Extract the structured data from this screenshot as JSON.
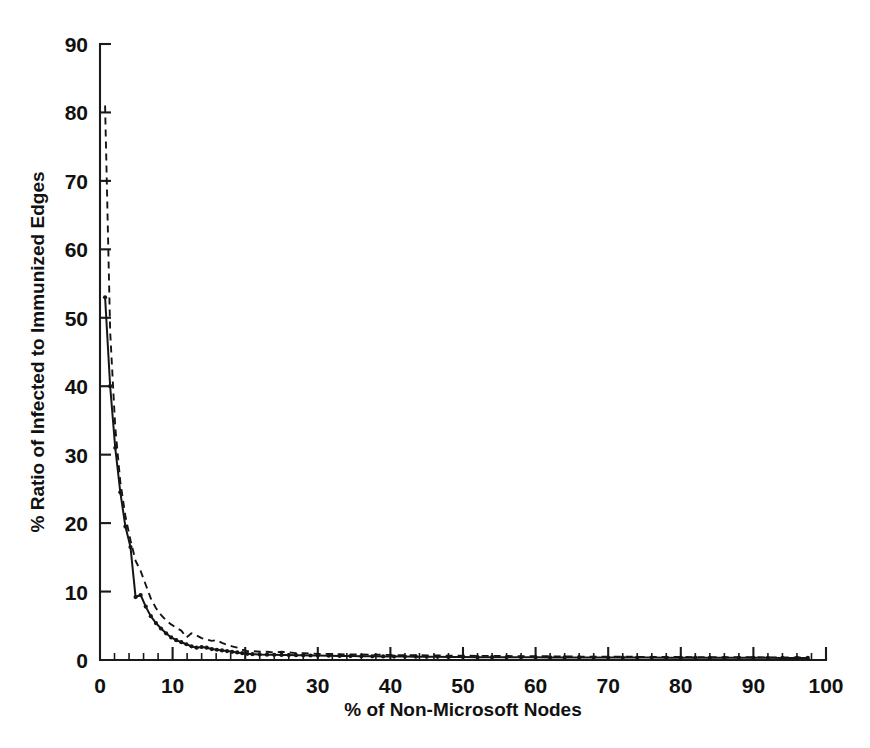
{
  "chart_data": {
    "type": "line",
    "title": "",
    "xlabel": "% of Non-Microsoft Nodes",
    "ylabel": "% Ratio of Infected to Immunized Edges",
    "xlim": [
      0,
      100
    ],
    "ylim": [
      0,
      90
    ],
    "xticks": [
      0,
      10,
      20,
      30,
      40,
      50,
      60,
      70,
      80,
      90,
      100
    ],
    "yticks": [
      0,
      10,
      20,
      30,
      40,
      50,
      60,
      70,
      80,
      90
    ],
    "xtick_labels": [
      "0",
      "10",
      "20",
      "30",
      "40",
      "50",
      "60",
      "70",
      "80",
      "90",
      "100"
    ],
    "ytick_labels": [
      "0",
      "10",
      "20",
      "30",
      "40",
      "50",
      "60",
      "70",
      "80",
      "90"
    ],
    "x_minor_step": 2,
    "grid": false,
    "legend": "none",
    "series": [
      {
        "name": "solid-curve",
        "style": "solid",
        "markers": true,
        "x": [
          0.7,
          1.4,
          2.1,
          2.8,
          3.5,
          4.2,
          4.9,
          5.6,
          6.3,
          7.0,
          7.7,
          8.4,
          9.1,
          9.8,
          10.5,
          11.2,
          11.9,
          12.6,
          13.3,
          14.0,
          14.7,
          15.4,
          16.1,
          16.8,
          17.5,
          18.2,
          18.9,
          19.6,
          20.3,
          21.0,
          22.0,
          23.0,
          24.0,
          25.0,
          26.0,
          27.0,
          28.0,
          29.0,
          30.0,
          31.5,
          33.0,
          34.5,
          36.0,
          37.5,
          39.0,
          40.5,
          42.0,
          43.5,
          45.0,
          46.5,
          48.0,
          50.0,
          52.0,
          54.0,
          56.0,
          58.0,
          60.0,
          62.0,
          64.0,
          66.0,
          68.0,
          70.0,
          72.0,
          74.0,
          76.0,
          78.0,
          80.0,
          82.0,
          84.0,
          86.0,
          88.0,
          90.0,
          92.0,
          94.0,
          96.0,
          97.5
        ],
        "y": [
          53.0,
          40.0,
          31.0,
          24.5,
          19.5,
          16.5,
          9.2,
          9.5,
          7.8,
          6.4,
          5.4,
          4.6,
          3.9,
          3.3,
          2.9,
          2.6,
          2.3,
          2.0,
          1.8,
          1.9,
          1.8,
          1.6,
          1.5,
          1.4,
          1.3,
          1.2,
          1.1,
          1.0,
          0.9,
          0.85,
          0.8,
          0.78,
          0.76,
          0.74,
          0.72,
          0.7,
          0.68,
          0.66,
          0.64,
          0.62,
          0.6,
          0.58,
          0.56,
          0.54,
          0.52,
          0.5,
          0.5,
          0.48,
          0.46,
          0.46,
          0.44,
          0.44,
          0.42,
          0.42,
          0.4,
          0.4,
          0.4,
          0.38,
          0.38,
          0.38,
          0.36,
          0.36,
          0.36,
          0.35,
          0.35,
          0.34,
          0.34,
          0.34,
          0.33,
          0.33,
          0.32,
          0.32,
          0.32,
          0.31,
          0.31,
          0.3
        ]
      },
      {
        "name": "dashed-curve",
        "style": "dashed",
        "markers": false,
        "x": [
          0.7,
          1.4,
          2.1,
          2.8,
          3.5,
          4.2,
          4.9,
          5.6,
          6.3,
          7.0,
          7.7,
          8.4,
          9.1,
          9.8,
          10.5,
          11.2,
          11.9,
          12.6,
          13.3,
          14.0,
          14.7,
          15.4,
          16.1,
          16.8,
          17.5,
          18.2,
          18.9,
          19.6,
          20.3,
          21.0,
          22.0,
          23.0,
          24.0,
          25.0,
          26.0,
          27.0,
          28.0,
          29.0,
          30.0,
          31.5,
          33.0,
          34.5,
          36.0,
          37.5,
          39.0,
          40.5,
          42.0,
          43.5,
          45.0,
          46.5,
          48.0,
          50.0,
          52.0,
          54.0,
          56.0,
          58.0,
          60.0,
          62.0,
          64.0,
          66.0,
          68.0,
          70.0,
          72.0,
          74.0,
          76.0,
          78.0,
          80.0,
          82.0,
          84.0,
          86.0,
          88.0,
          90.0,
          92.0,
          94.0,
          96.0,
          97.5
        ],
        "y": [
          81.0,
          48.0,
          34.0,
          26.0,
          21.0,
          17.5,
          14.5,
          13.0,
          11.0,
          9.0,
          7.6,
          6.6,
          5.8,
          5.2,
          4.7,
          4.3,
          3.3,
          3.9,
          3.6,
          3.2,
          3.0,
          2.8,
          2.9,
          2.5,
          2.2,
          2.0,
          1.8,
          1.5,
          1.3,
          1.3,
          1.2,
          1.2,
          1.1,
          1.2,
          1.1,
          1.0,
          1.0,
          0.95,
          0.9,
          0.9,
          0.85,
          0.8,
          0.8,
          0.78,
          0.75,
          0.72,
          0.7,
          0.7,
          0.68,
          0.66,
          0.64,
          0.62,
          0.6,
          0.6,
          0.58,
          0.56,
          0.55,
          0.54,
          0.52,
          0.5,
          0.5,
          0.48,
          0.48,
          0.46,
          0.45,
          0.44,
          0.44,
          0.42,
          0.42,
          0.4,
          0.4,
          0.4,
          0.38,
          0.38,
          0.36,
          0.35
        ]
      }
    ]
  }
}
